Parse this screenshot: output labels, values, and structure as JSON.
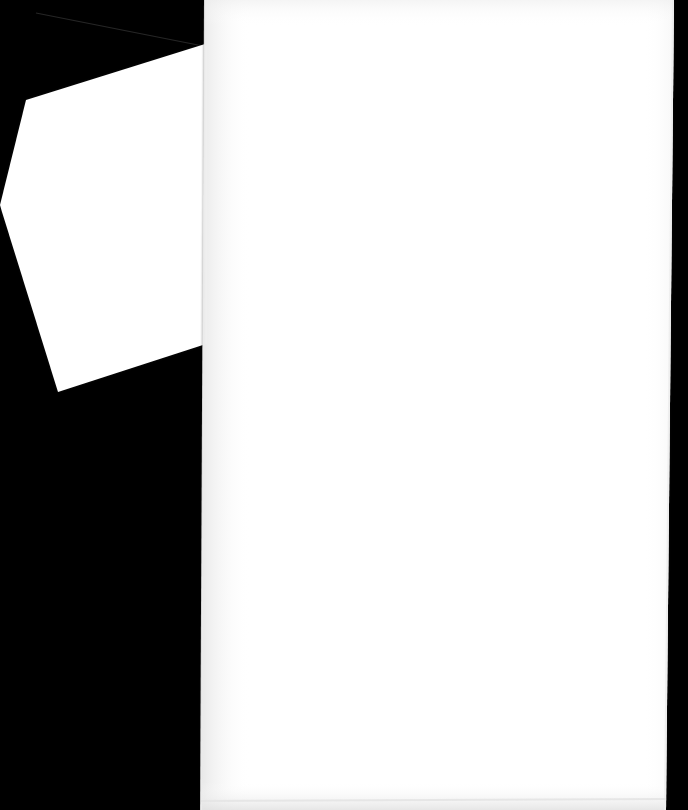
{
  "image": {
    "width": 688,
    "height": 810,
    "background_color": "#000000",
    "kind": "scanned-document-photo",
    "visible_text": "",
    "caption": ""
  },
  "colors": {
    "background": "#000000",
    "page_white": "#ffffff",
    "page_white_shaded": "#fbfbfb",
    "page_edge_gray": "#e8e8e8",
    "hairline_gray": "#2a2a2a",
    "soft_shadow": "#0d0d0d"
  },
  "pages": [
    {
      "id": "back-page",
      "label": "Back page (partially visible, rotated)",
      "fill": "#ffffff",
      "text": "",
      "points": [
        [
          205,
          44
        ],
        [
          26,
          100
        ],
        [
          0,
          205
        ],
        [
          2,
          212
        ],
        [
          58,
          392
        ],
        [
          206,
          344
        ]
      ]
    },
    {
      "id": "front-page",
      "label": "Front page (blank recto)",
      "fill": "#ffffff",
      "text": "",
      "points": [
        [
          205,
          0
        ],
        [
          674,
          0
        ],
        [
          666,
          810
        ],
        [
          201,
          810
        ]
      ]
    }
  ],
  "marks": [
    {
      "id": "top-hairline",
      "label": "Faint diagonal hairline along upper page edge",
      "color": "#2a2a2a",
      "width": 1.1,
      "from": [
        36,
        13
      ],
      "to": [
        203,
        46
      ]
    }
  ],
  "edges": [
    {
      "id": "front-page-left-edge",
      "label": "Front page left edge shading",
      "color": "#ececec",
      "from": [
        205,
        0
      ],
      "to": [
        201,
        810
      ],
      "width": 2.0
    },
    {
      "id": "front-page-right-edge",
      "label": "Front page right edge shading",
      "color": "#ededed",
      "from": [
        673,
        0
      ],
      "to": [
        665,
        810
      ],
      "width": 2.0
    },
    {
      "id": "front-page-bottom-edge",
      "label": "Front page bottom edge shading",
      "color": "#e4e4e4",
      "from": [
        201,
        801
      ],
      "to": [
        666,
        799
      ],
      "width": 2.2
    },
    {
      "id": "back-page-inner-edge",
      "label": "Back page edge where it tucks under front page",
      "color": "#efefef",
      "from": [
        206,
        46
      ],
      "to": [
        206,
        344
      ],
      "width": 1.6
    }
  ],
  "annotations": {
    "document_title": "",
    "page_number": "",
    "note": ""
  }
}
